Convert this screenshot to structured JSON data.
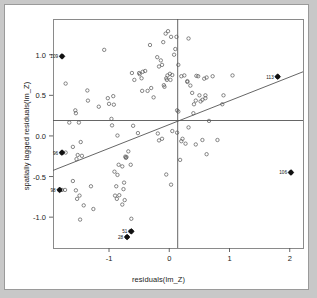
{
  "figure": {
    "kind": "moran-scatterplot",
    "background_color": "#c8c8c8",
    "panel_color": "#ffffff",
    "frame_color": "#9a9a9a",
    "point_color": "#555555",
    "line_color": "#555555",
    "highlight_color": "#111111"
  },
  "chart_data": {
    "type": "scatter",
    "title": "",
    "xlabel": "residuals(lm_Z)",
    "ylabel": "spatially lagged residuals(lm_Z)",
    "xlim": [
      -1.93,
      2.22
    ],
    "ylim": [
      -1.38,
      1.44
    ],
    "xticks": [
      -1,
      0,
      1,
      2
    ],
    "xticklabels": [
      "-1",
      "0",
      "1",
      "2"
    ],
    "yticks": [
      -1.0,
      -0.5,
      0.0,
      0.5,
      1.0
    ],
    "yticklabels": [
      "-1.0",
      "-0.5",
      "0.0",
      "0.5",
      "1.0"
    ],
    "grid": false,
    "legend": null,
    "reference_lines": {
      "vertical_x": 0.14,
      "horizontal_y": 0.19
    },
    "regression_line": {
      "x": [
        -1.93,
        2.22
      ],
      "y": [
        -0.425,
        0.79
      ],
      "slope": 0.292,
      "intercept": 0.139
    },
    "marker": "open-circle",
    "points": [
      [
        -1.78,
        0.98
      ],
      [
        -1.72,
        0.645
      ],
      [
        -1.55,
        0.28
      ],
      [
        -1.56,
        0.315
      ],
      [
        -1.72,
        -0.205
      ],
      [
        -1.79,
        -0.21
      ],
      [
        -1.78,
        -0.665
      ],
      [
        -1.73,
        -0.665
      ],
      [
        -1.66,
        0.165
      ],
      [
        -1.5,
        0.165
      ],
      [
        -1.6,
        -0.135
      ],
      [
        -1.47,
        -0.075
      ],
      [
        -1.52,
        -0.235
      ],
      [
        -1.45,
        -0.245
      ],
      [
        -1.54,
        -0.285
      ],
      [
        -1.6,
        -0.555
      ],
      [
        -1.42,
        -0.855
      ],
      [
        -1.48,
        -1.03
      ],
      [
        -1.55,
        -0.67
      ],
      [
        -1.49,
        -0.735
      ],
      [
        -1.53,
        -0.775
      ],
      [
        -1.36,
        0.56
      ],
      [
        -1.35,
        0.435
      ],
      [
        -1.3,
        -0.62
      ],
      [
        -1.26,
        -0.9
      ],
      [
        -1.17,
        0.36
      ],
      [
        -1.08,
        1.06
      ],
      [
        -1.02,
        0.465
      ],
      [
        -1.0,
        0.395
      ],
      [
        -0.93,
        0.49
      ],
      [
        -0.92,
        0.385
      ],
      [
        -0.96,
        0.21
      ],
      [
        -0.95,
        0.13
      ],
      [
        -0.86,
        0.005
      ],
      [
        -0.91,
        -0.44
      ],
      [
        -0.86,
        -0.48
      ],
      [
        -0.84,
        -0.355
      ],
      [
        -0.78,
        -0.375
      ],
      [
        -0.88,
        -0.62
      ],
      [
        -0.9,
        -0.735
      ],
      [
        -0.87,
        -0.775
      ],
      [
        -0.83,
        -0.73
      ],
      [
        -0.76,
        -0.655
      ],
      [
        -0.75,
        -0.575
      ],
      [
        -0.74,
        -0.79
      ],
      [
        -0.78,
        -0.845
      ],
      [
        -0.73,
        -0.255
      ],
      [
        -0.72,
        -0.27
      ],
      [
        -0.71,
        -0.26
      ],
      [
        -0.68,
        -0.19
      ],
      [
        -0.64,
        -0.355
      ],
      [
        -0.62,
        0.775
      ],
      [
        -0.58,
        0.69
      ],
      [
        -0.5,
        0.775
      ],
      [
        -0.49,
        0.76
      ],
      [
        -0.46,
        0.71
      ],
      [
        -0.45,
        0.555
      ],
      [
        -0.44,
        0.79
      ],
      [
        -0.4,
        0.8
      ],
      [
        -0.36,
        0.555
      ],
      [
        -0.52,
        0.035
      ],
      [
        -0.6,
        0.125
      ],
      [
        -0.63,
        -1.02
      ],
      [
        -0.65,
        -1.175
      ],
      [
        -0.7,
        -1.245
      ],
      [
        -0.32,
        1.12
      ],
      [
        -0.2,
        0.97
      ],
      [
        -0.14,
        0.93
      ],
      [
        -0.12,
        0.875
      ],
      [
        -0.17,
        0.855
      ],
      [
        -0.1,
        1.155
      ],
      [
        -0.06,
        1.26
      ],
      [
        -0.02,
        1.29
      ],
      [
        0.03,
        1.22
      ],
      [
        0.12,
        1.22
      ],
      [
        0.32,
        1.2
      ],
      [
        -0.03,
        0.745
      ],
      [
        -0.05,
        0.71
      ],
      [
        0.01,
        0.765
      ],
      [
        0.05,
        0.75
      ],
      [
        0.08,
        1.0
      ],
      [
        0.1,
        1.07
      ],
      [
        0.15,
        0.875
      ],
      [
        0.2,
        0.735
      ],
      [
        0.25,
        0.745
      ],
      [
        0.3,
        0.665
      ],
      [
        -0.09,
        0.625
      ],
      [
        -0.08,
        0.605
      ],
      [
        -0.04,
        0.69
      ],
      [
        0.02,
        0.69
      ],
      [
        0.35,
        0.62
      ],
      [
        0.45,
        0.74
      ],
      [
        0.48,
        0.735
      ],
      [
        0.58,
        0.705
      ],
      [
        0.62,
        0.72
      ],
      [
        0.72,
        0.735
      ],
      [
        0.5,
        0.5
      ],
      [
        0.55,
        0.445
      ],
      [
        0.6,
        0.465
      ],
      [
        0.52,
        0.425
      ],
      [
        0.38,
        0.53
      ],
      [
        0.41,
        0.39
      ],
      [
        0.44,
        0.435
      ],
      [
        0.6,
        0.5
      ],
      [
        0.13,
        0.315
      ],
      [
        0.15,
        0.3
      ],
      [
        0.4,
        0.28
      ],
      [
        0.66,
        0.185
      ],
      [
        -0.19,
        0.03
      ],
      [
        -0.12,
        -0.035
      ],
      [
        -0.17,
        -0.055
      ],
      [
        0.05,
        0.06
      ],
      [
        0.13,
        0.04
      ],
      [
        0.32,
        0.105
      ],
      [
        0.22,
        -0.035
      ],
      [
        0.2,
        -0.065
      ],
      [
        0.27,
        -0.095
      ],
      [
        0.44,
        -0.105
      ],
      [
        0.55,
        -0.05
      ],
      [
        0.8,
        -0.05
      ],
      [
        0.18,
        -0.295
      ],
      [
        -0.05,
        -0.475
      ],
      [
        0.03,
        -0.6
      ],
      [
        0.62,
        -0.225
      ],
      [
        1.8,
        0.73
      ],
      [
        2.02,
        -0.45
      ],
      [
        0.9,
        0.5
      ],
      [
        0.88,
        0.39
      ],
      [
        1.05,
        0.745
      ],
      [
        0.3,
        0.675
      ],
      [
        -0.26,
        0.475
      ],
      [
        -0.3,
        0.59
      ]
    ],
    "highlighted_points": [
      {
        "label": "109",
        "x": -1.78,
        "y": 0.98
      },
      {
        "label": "113",
        "x": 1.8,
        "y": 0.73
      },
      {
        "label": "96",
        "x": -1.78,
        "y": -0.205
      },
      {
        "label": "98",
        "x": -1.82,
        "y": -0.665
      },
      {
        "label": "106",
        "x": 2.02,
        "y": -0.45
      },
      {
        "label": "51",
        "x": -0.63,
        "y": -1.175
      },
      {
        "label": "28",
        "x": -0.7,
        "y": -1.245
      }
    ]
  }
}
